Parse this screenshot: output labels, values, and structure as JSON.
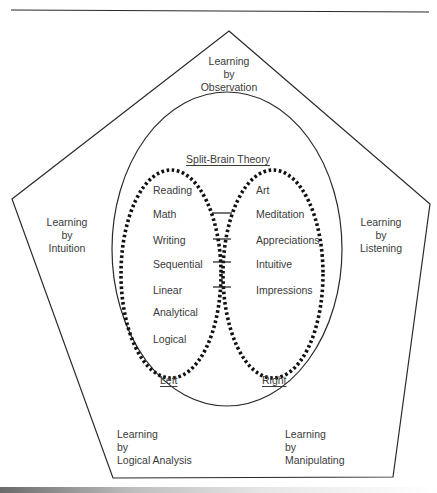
{
  "diagram": {
    "title": "Split-Brain Theory",
    "outer_shape": "pentagon",
    "inner_shape": "ellipse",
    "learning_modes": {
      "top": [
        "Learning",
        "by",
        "Observation"
      ],
      "left": [
        "Learning",
        "by",
        "Intuition"
      ],
      "right": [
        "Learning",
        "by",
        "Listening"
      ],
      "bottom_left": [
        "Learning",
        "by",
        "Logical Analysis"
      ],
      "bottom_right": [
        "Learning",
        "by",
        "Manipulating"
      ]
    },
    "hemispheres": {
      "left": {
        "label": "Left",
        "items": [
          "Reading",
          "Math",
          "Writing",
          "Sequential",
          "Linear",
          "Analytical",
          "Logical"
        ]
      },
      "right": {
        "label": "Right",
        "items": [
          "Art",
          "Meditation",
          "Appreciations",
          "Intuitive",
          "Impressions"
        ]
      }
    },
    "colors": {
      "line": "#2a2a2a",
      "text": "#3a3a3a",
      "background": "#ffffff"
    }
  }
}
